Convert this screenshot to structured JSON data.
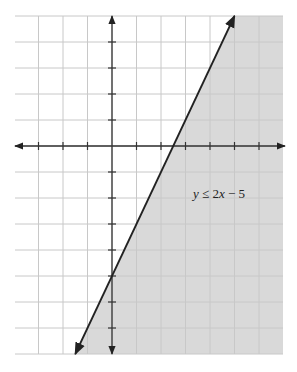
{
  "chart_data": {
    "type": "line",
    "title": "",
    "xlabel": "",
    "ylabel": "",
    "inequality": "y ≤ 2x − 5",
    "boundary_line": {
      "slope": 2,
      "intercept": -5,
      "style": "solid"
    },
    "shaded_region": "below-right of line",
    "xlim": [
      -4,
      7
    ],
    "ylim": [
      -8,
      5
    ],
    "x_ticks": [
      -3,
      -2,
      -1,
      1,
      2,
      3,
      4,
      5,
      6
    ],
    "y_ticks": [
      4,
      3,
      2,
      1,
      -1,
      -2,
      -3,
      -4,
      -5,
      -6,
      -7
    ],
    "grid": true,
    "legend": null,
    "colors": {
      "shade": "#d9d9d9",
      "grid": "#c8c8c8",
      "axis": "#333333",
      "line": "#222222"
    }
  },
  "annotation": {
    "text_y": "y",
    "text_op": " ≤ 2",
    "text_x": "x",
    "text_rest": " − 5"
  }
}
